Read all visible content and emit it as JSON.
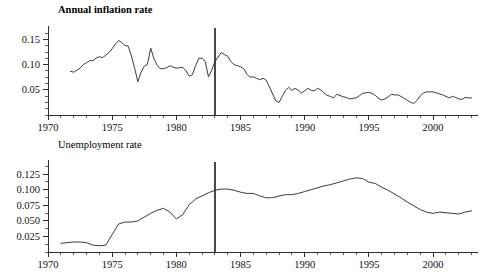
{
  "figure": {
    "background": "#ffffff",
    "line_color": "#303030",
    "axis_color": "#1a1a1a",
    "marker_color": "#4a4a4a"
  },
  "chart_data": [
    {
      "type": "line",
      "id": "inflation",
      "title": "Annual inflation rate",
      "title_bold": true,
      "xlabel": "",
      "ylabel": "",
      "grid": false,
      "legend": "none",
      "xlim": [
        1970,
        2003.5
      ],
      "ylim": [
        0.0,
        0.165
      ],
      "xticks": [
        1970,
        1975,
        1980,
        1985,
        1990,
        1995,
        2000
      ],
      "xtick_labels": [
        "1970",
        "1975",
        "1980",
        "1985",
        "1990",
        "1995",
        "2000"
      ],
      "xtick_minor_step": 1,
      "yticks": [
        0.05,
        0.1,
        0.15
      ],
      "ytick_labels": [
        "0.05",
        "0.10",
        "0.15"
      ],
      "ytick_minor_step": 0.0125,
      "annotations": [
        {
          "kind": "vertical-line",
          "x": 1983.0,
          "label": "regime-break-1983"
        }
      ],
      "x": [
        1971.75,
        1972.0,
        1972.25,
        1972.5,
        1972.75,
        1973.0,
        1973.25,
        1973.5,
        1973.75,
        1974.0,
        1974.25,
        1974.5,
        1974.75,
        1975.0,
        1975.25,
        1975.5,
        1975.75,
        1976.0,
        1976.25,
        1976.5,
        1976.75,
        1977.0,
        1977.25,
        1977.5,
        1977.75,
        1978.0,
        1978.25,
        1978.5,
        1978.75,
        1979.0,
        1979.25,
        1979.5,
        1979.75,
        1980.0,
        1980.25,
        1980.5,
        1980.75,
        1981.0,
        1981.25,
        1981.5,
        1981.75,
        1982.0,
        1982.25,
        1982.5,
        1982.75,
        1983.0,
        1983.25,
        1983.5,
        1983.75,
        1984.0,
        1984.25,
        1984.5,
        1984.75,
        1985.0,
        1985.25,
        1985.5,
        1985.75,
        1986.0,
        1986.25,
        1986.5,
        1986.75,
        1987.0,
        1987.25,
        1987.5,
        1987.75,
        1988.0,
        1988.25,
        1988.5,
        1988.75,
        1989.0,
        1989.25,
        1989.5,
        1989.75,
        1990.0,
        1990.25,
        1990.5,
        1990.75,
        1991.0,
        1991.25,
        1991.5,
        1991.75,
        1992.0,
        1992.25,
        1992.5,
        1992.75,
        1993.0,
        1993.25,
        1993.5,
        1993.75,
        1994.0,
        1994.25,
        1994.5,
        1994.75,
        1995.0,
        1995.25,
        1995.5,
        1995.75,
        1996.0,
        1996.25,
        1996.5,
        1996.75,
        1997.0,
        1997.25,
        1997.5,
        1997.75,
        1998.0,
        1998.25,
        1998.5,
        1998.75,
        1999.0,
        1999.25,
        1999.5,
        1999.75,
        2000.0,
        2000.25,
        2000.5,
        2000.75,
        2001.0,
        2001.25,
        2001.5,
        2001.75,
        2002.0,
        2002.25,
        2002.5,
        2002.75,
        2003.0
      ],
      "y": [
        0.087,
        0.085,
        0.089,
        0.093,
        0.1,
        0.104,
        0.108,
        0.108,
        0.113,
        0.116,
        0.114,
        0.119,
        0.124,
        0.132,
        0.141,
        0.148,
        0.144,
        0.138,
        0.137,
        0.117,
        0.093,
        0.066,
        0.085,
        0.097,
        0.101,
        0.133,
        0.112,
        0.099,
        0.092,
        0.092,
        0.094,
        0.098,
        0.095,
        0.093,
        0.094,
        0.095,
        0.088,
        0.077,
        0.08,
        0.098,
        0.113,
        0.113,
        0.106,
        0.076,
        0.089,
        0.106,
        0.115,
        0.124,
        0.12,
        0.117,
        0.106,
        0.1,
        0.098,
        0.096,
        0.092,
        0.081,
        0.075,
        0.076,
        0.073,
        0.07,
        0.073,
        0.069,
        0.056,
        0.042,
        0.028,
        0.025,
        0.037,
        0.049,
        0.055,
        0.049,
        0.053,
        0.049,
        0.044,
        0.048,
        0.053,
        0.049,
        0.048,
        0.053,
        0.05,
        0.044,
        0.039,
        0.037,
        0.034,
        0.041,
        0.039,
        0.036,
        0.035,
        0.032,
        0.033,
        0.034,
        0.038,
        0.043,
        0.044,
        0.045,
        0.043,
        0.039,
        0.033,
        0.03,
        0.032,
        0.036,
        0.041,
        0.04,
        0.04,
        0.037,
        0.033,
        0.029,
        0.025,
        0.023,
        0.029,
        0.038,
        0.044,
        0.046,
        0.046,
        0.046,
        0.044,
        0.042,
        0.04,
        0.037,
        0.034,
        0.037,
        0.035,
        0.032,
        0.031,
        0.035,
        0.034,
        0.034
      ]
    },
    {
      "type": "line",
      "id": "unemployment",
      "title": "Unemployment rate",
      "title_bold": false,
      "xlabel": "",
      "ylabel": "",
      "grid": false,
      "legend": "none",
      "xlim": [
        1970,
        2003.5
      ],
      "ylim": [
        0.0,
        0.138
      ],
      "xticks": [
        1970,
        1975,
        1980,
        1985,
        1990,
        1995,
        2000
      ],
      "xtick_labels": [
        "1970",
        "1975",
        "1980",
        "1985",
        "1990",
        "1995",
        "2000"
      ],
      "xtick_minor_step": 1,
      "yticks": [
        0.025,
        0.05,
        0.075,
        0.1,
        0.125
      ],
      "ytick_labels": [
        "0.025",
        "0.050",
        "0.075",
        "0.100",
        "0.125"
      ],
      "ytick_minor_step": 0.0125,
      "annotations": [
        {
          "kind": "vertical-line",
          "x": 1983.0,
          "label": "regime-break-1983"
        }
      ],
      "x": [
        1971.0,
        1971.5,
        1972.0,
        1972.5,
        1973.0,
        1973.5,
        1974.0,
        1974.5,
        1975.0,
        1975.5,
        1976.0,
        1976.5,
        1977.0,
        1977.5,
        1978.0,
        1978.5,
        1979.0,
        1979.5,
        1980.0,
        1980.5,
        1981.0,
        1981.5,
        1982.0,
        1982.5,
        1983.0,
        1983.5,
        1984.0,
        1984.5,
        1985.0,
        1985.5,
        1986.0,
        1986.5,
        1987.0,
        1987.5,
        1988.0,
        1988.5,
        1989.0,
        1989.5,
        1990.0,
        1990.5,
        1991.0,
        1991.5,
        1992.0,
        1992.5,
        1993.0,
        1993.5,
        1994.0,
        1994.5,
        1995.0,
        1995.5,
        1996.0,
        1996.5,
        1997.0,
        1997.5,
        1998.0,
        1998.5,
        1999.0,
        1999.5,
        2000.0,
        2000.5,
        2001.0,
        2001.5,
        2002.0,
        2002.5,
        2003.0
      ],
      "y": [
        0.014,
        0.015,
        0.016,
        0.016,
        0.015,
        0.011,
        0.01,
        0.011,
        0.028,
        0.045,
        0.048,
        0.048,
        0.05,
        0.056,
        0.062,
        0.067,
        0.07,
        0.064,
        0.053,
        0.06,
        0.076,
        0.085,
        0.09,
        0.095,
        0.099,
        0.101,
        0.101,
        0.099,
        0.096,
        0.094,
        0.094,
        0.09,
        0.087,
        0.087,
        0.09,
        0.092,
        0.092,
        0.094,
        0.097,
        0.1,
        0.103,
        0.106,
        0.108,
        0.111,
        0.114,
        0.117,
        0.119,
        0.118,
        0.112,
        0.11,
        0.104,
        0.099,
        0.093,
        0.087,
        0.08,
        0.074,
        0.068,
        0.064,
        0.062,
        0.064,
        0.063,
        0.062,
        0.061,
        0.064,
        0.066
      ]
    }
  ]
}
